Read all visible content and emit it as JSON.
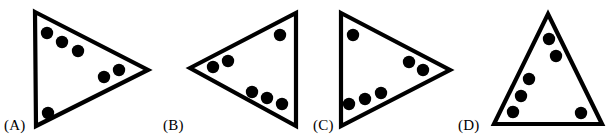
{
  "sheet": {
    "width": 615,
    "height": 138,
    "background_color": "#ffffff",
    "ink_color": "#000000"
  },
  "question": {
    "figure_type": "triangle-with-dots-multiple-choice",
    "option_count": 4
  },
  "options": [
    {
      "id": "A",
      "label": "(A)",
      "label_x": 4,
      "label_y": 118,
      "orientation": "points-right",
      "triangle": {
        "points": "35,12 148,70 36,126",
        "vertices": [
          {
            "name": "top-left",
            "x": 35,
            "y": 12
          },
          {
            "name": "right-point",
            "x": 148,
            "y": 70
          },
          {
            "name": "bottom-left",
            "x": 36,
            "y": 126
          }
        ]
      },
      "dot_count": 6,
      "dots": [
        {
          "x": 47,
          "y": 33,
          "r": 6.2
        },
        {
          "x": 62,
          "y": 42,
          "r": 6.2
        },
        {
          "x": 78,
          "y": 51,
          "r": 6.2
        },
        {
          "x": 104,
          "y": 77,
          "r": 6.2
        },
        {
          "x": 119,
          "y": 70,
          "r": 6.2
        },
        {
          "x": 48,
          "y": 113,
          "r": 6.2
        }
      ]
    },
    {
      "id": "B",
      "label": "(B)",
      "label_x": 163,
      "label_y": 118,
      "orientation": "points-left",
      "triangle": {
        "points": "190,68 296,13 296,126",
        "vertices": [
          {
            "name": "left-point",
            "x": 190,
            "y": 68
          },
          {
            "name": "top-right",
            "x": 296,
            "y": 13
          },
          {
            "name": "bottom-right",
            "x": 296,
            "y": 126
          }
        ]
      },
      "dot_count": 6,
      "dots": [
        {
          "x": 213,
          "y": 67,
          "r": 6.2
        },
        {
          "x": 228,
          "y": 61,
          "r": 6.2
        },
        {
          "x": 280,
          "y": 35,
          "r": 6.2
        },
        {
          "x": 252,
          "y": 92,
          "r": 6.2
        },
        {
          "x": 267,
          "y": 98,
          "r": 6.2
        },
        {
          "x": 282,
          "y": 104,
          "r": 6.2
        }
      ]
    },
    {
      "id": "C",
      "label": "(C)",
      "label_x": 313,
      "label_y": 118,
      "orientation": "points-right",
      "triangle": {
        "points": "341,13 450,70 341,126",
        "vertices": [
          {
            "name": "top-left",
            "x": 341,
            "y": 13
          },
          {
            "name": "right-point",
            "x": 450,
            "y": 70
          },
          {
            "name": "bottom-left",
            "x": 341,
            "y": 126
          }
        ]
      },
      "dot_count": 6,
      "dots": [
        {
          "x": 353,
          "y": 35,
          "r": 6.2
        },
        {
          "x": 409,
          "y": 62,
          "r": 6.2
        },
        {
          "x": 423,
          "y": 70,
          "r": 6.2
        },
        {
          "x": 349,
          "y": 104,
          "r": 6.2
        },
        {
          "x": 365,
          "y": 99,
          "r": 6.2
        },
        {
          "x": 381,
          "y": 93,
          "r": 6.2
        }
      ]
    },
    {
      "id": "D",
      "label": "(D)",
      "label_x": 458,
      "label_y": 118,
      "orientation": "points-up",
      "triangle": {
        "points": "548,14 602,124 494,124",
        "vertices": [
          {
            "name": "apex",
            "x": 548,
            "y": 14
          },
          {
            "name": "bottom-right",
            "x": 602,
            "y": 124
          },
          {
            "name": "bottom-left",
            "x": 494,
            "y": 124
          }
        ]
      },
      "dot_count": 6,
      "dots": [
        {
          "x": 549,
          "y": 39,
          "r": 6.2
        },
        {
          "x": 556,
          "y": 56,
          "r": 6.2
        },
        {
          "x": 529,
          "y": 79,
          "r": 6.2
        },
        {
          "x": 521,
          "y": 96,
          "r": 6.2
        },
        {
          "x": 513,
          "y": 112,
          "r": 6.2
        },
        {
          "x": 581,
          "y": 113,
          "r": 6.2
        }
      ]
    }
  ]
}
